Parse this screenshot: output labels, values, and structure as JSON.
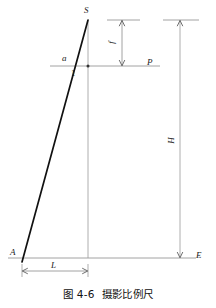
{
  "figure": {
    "caption_number": "图 4-6",
    "caption_title": "摄影比例尺",
    "colors": {
      "ray": "#111111",
      "construction": "#8a8a8a",
      "text": "#1a1a1a"
    }
  },
  "labels": {
    "apex": "S",
    "image_point": "a",
    "principal_point": "1",
    "image_plane": "P",
    "ground_point": "A",
    "ground_end": "E",
    "focal_length": "f",
    "flying_height": "H",
    "ground_distance": "L"
  },
  "diagram_data": {
    "type": "line-diagram",
    "description": "Photogrammetric scale geometry: perspective centre S, image plane P, ground plane A-E",
    "points": [
      {
        "name": "S",
        "x": 88,
        "y": 20,
        "role": "perspective-centre"
      },
      {
        "name": "a",
        "x": 72,
        "y": 66,
        "role": "image-point"
      },
      {
        "name": "1",
        "x": 88,
        "y": 66,
        "role": "principal-point"
      },
      {
        "name": "A",
        "x": 22,
        "y": 258,
        "role": "ground-point"
      },
      {
        "name": "E",
        "x": 180,
        "y": 258,
        "role": "ground-right-end"
      }
    ],
    "lines": [
      {
        "name": "ray-SA",
        "from": "S",
        "to": "A",
        "weight": "thick"
      },
      {
        "name": "optical-axis",
        "from": [
          88,
          20
        ],
        "to": [
          88,
          258
        ],
        "weight": "thin"
      },
      {
        "name": "image-plane-P",
        "from": [
          50,
          66
        ],
        "to": [
          160,
          66
        ],
        "weight": "thin"
      },
      {
        "name": "ground-line",
        "from": [
          8,
          258
        ],
        "to": [
          196,
          258
        ],
        "weight": "thin"
      },
      {
        "name": "height-line-H",
        "from": [
          180,
          20
        ],
        "to": [
          180,
          258
        ],
        "weight": "thin"
      }
    ],
    "dimensions": [
      {
        "name": "f",
        "orientation": "vertical",
        "from": [
          122,
          20
        ],
        "to": [
          122,
          66
        ]
      },
      {
        "name": "H",
        "orientation": "vertical",
        "from": [
          180,
          20
        ],
        "to": [
          180,
          258
        ]
      },
      {
        "name": "L",
        "orientation": "horizontal",
        "from": [
          22,
          271
        ],
        "to": [
          88,
          271
        ]
      }
    ]
  }
}
